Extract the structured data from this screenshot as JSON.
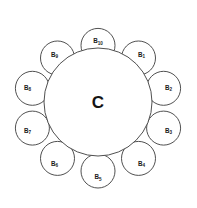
{
  "diagram": {
    "type": "cluster-radial",
    "background_color": "#ffffff",
    "stroke_color": "#3c3c3c",
    "fill_color": "#ffffff",
    "canvas": {
      "width": 197,
      "height": 208
    },
    "center": {
      "label": "C",
      "label_base": "C",
      "label_subscript": "",
      "cx": 98,
      "cy": 102,
      "r": 54
    },
    "ring": {
      "radius": 69,
      "node_radius": 17,
      "count": 10
    },
    "nodes": [
      {
        "id": "B1",
        "label_base": "B",
        "label_subscript": "1",
        "cx": 138.5,
        "cy": 58.0,
        "r": 17,
        "angle_deg": 54
      },
      {
        "id": "B2",
        "label_base": "B",
        "label_subscript": "2",
        "cx": 163.6,
        "cy": 88.3,
        "r": 17,
        "angle_deg": 18
      },
      {
        "id": "B3",
        "label_base": "B",
        "label_subscript": "3",
        "cx": 163.6,
        "cy": 128.1,
        "r": 17,
        "angle_deg": -18
      },
      {
        "id": "B4",
        "label_base": "B",
        "label_subscript": "4",
        "cx": 138.5,
        "cy": 158.4,
        "r": 17,
        "angle_deg": -54
      },
      {
        "id": "B5",
        "label_base": "B",
        "label_subscript": "5",
        "cx": 98.0,
        "cy": 171.0,
        "r": 17,
        "angle_deg": -90
      },
      {
        "id": "B6",
        "label_base": "B",
        "label_subscript": "6",
        "cx": 57.5,
        "cy": 158.4,
        "r": 17,
        "angle_deg": -126
      },
      {
        "id": "B7",
        "label_base": "B",
        "label_subscript": "7",
        "cx": 32.4,
        "cy": 128.1,
        "r": 17,
        "angle_deg": -162
      },
      {
        "id": "B8",
        "label_base": "B",
        "label_subscript": "8",
        "cx": 32.4,
        "cy": 88.3,
        "r": 17,
        "angle_deg": 162
      },
      {
        "id": "B9",
        "label_base": "B",
        "label_subscript": "9",
        "cx": 57.5,
        "cy": 58.0,
        "r": 17,
        "angle_deg": 126
      },
      {
        "id": "B10",
        "label_base": "B",
        "label_subscript": "10",
        "cx": 98.0,
        "cy": 45.4,
        "r": 17,
        "angle_deg": 90
      }
    ]
  }
}
